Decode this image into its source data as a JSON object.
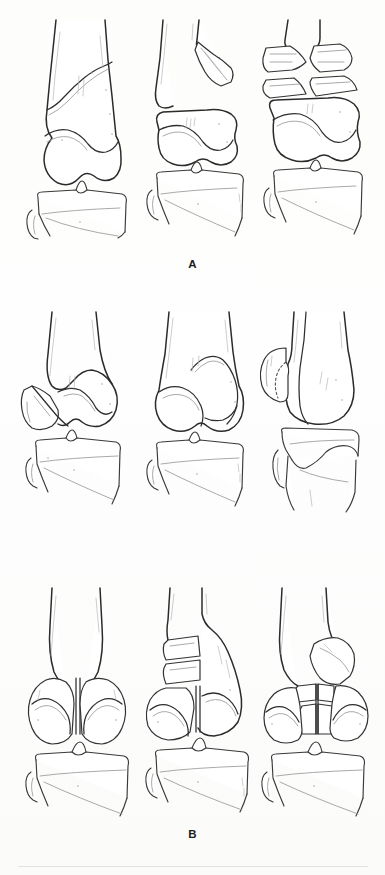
{
  "figure": {
    "kind": "medical-line-illustration",
    "view": "anteroposterior and lateral knee (distal femur, proximal tibia, fibula)",
    "background_color": "#fdfdfc",
    "ink_color": "#2b2b2b",
    "shade_color": "#9a9a9a",
    "panels": [
      {
        "label": "A",
        "label_y": 258,
        "row_top": 18,
        "description": "Extra-articular supracondylar distal femoral fractures",
        "figures": [
          {
            "index": 1,
            "x": 22,
            "caption": "Oblique supracondylar fracture, minimally displaced",
            "features": [
              "femoral shaft",
              "oblique supracondylar fracture line",
              "femoral condyles intact",
              "tibial plateau",
              "fibular head"
            ]
          },
          {
            "index": 2,
            "x": 143,
            "caption": "Displaced supracondylar fracture with separated condylar block",
            "features": [
              "femoral shaft",
              "angulated spike fragment",
              "displaced condylar block",
              "tibial plateau",
              "fibular head"
            ]
          },
          {
            "index": 3,
            "x": 258,
            "caption": "Comminuted supracondylar fracture with butterfly fragments",
            "features": [
              "femoral shaft",
              "multiple butterfly fragments",
              "condylar block",
              "tibial plateau",
              "fibular head"
            ]
          }
        ]
      },
      {
        "label": "B",
        "label_y": 528,
        "row_top": 310,
        "description": "Unicondylar distal femoral fractures",
        "figures": [
          {
            "index": 1,
            "x": 18,
            "caption": "Medial unicondylar fracture, displaced",
            "features": [
              "femoral shaft",
              "displaced medial condyle fragment",
              "oblique sagittal fracture line",
              "tibial plateau",
              "fibular head"
            ]
          },
          {
            "index": 2,
            "x": 143,
            "caption": "Lateral unicondylar fracture, in situ",
            "features": [
              "femoral shaft",
              "lateral condyle fragment",
              "oblique sagittal fracture line",
              "tibial plateau",
              "fibular head"
            ]
          },
          {
            "index": 3,
            "x": 256,
            "caption": "Coronal plane (Hoffa) condylar fracture, lateral view",
            "features": [
              "femoral shaft lateral view",
              "rotated posterior condylar fragment",
              "dotted hidden contour",
              "tibial plateau lateral",
              "fibula"
            ]
          }
        ]
      },
      {
        "label": "C",
        "label_y": 846,
        "row_top": 586,
        "description": "Intercondylar bicondylar distal femoral fractures",
        "figures": [
          {
            "index": 1,
            "x": 20,
            "caption": "Simple T/Y intercondylar fracture",
            "features": [
              "femoral shaft",
              "vertical intercondylar split",
              "medial condyle fragment",
              "lateral condyle fragment",
              "tibial plateau",
              "fibular head"
            ]
          },
          {
            "index": 2,
            "x": 142,
            "caption": "Intercondylar fracture with supracondylar comminution",
            "features": [
              "femoral shaft",
              "segmental medial fragments",
              "intercondylar split",
              "condylar fragments",
              "tibial plateau",
              "fibular head"
            ]
          },
          {
            "index": 3,
            "x": 256,
            "caption": "Complex intercondylar fracture with central comminution",
            "features": [
              "femoral shaft",
              "wedge fragment",
              "central comminuted fragments",
              "condylar fragments",
              "tibial plateau",
              "fibular head"
            ]
          }
        ]
      }
    ]
  }
}
